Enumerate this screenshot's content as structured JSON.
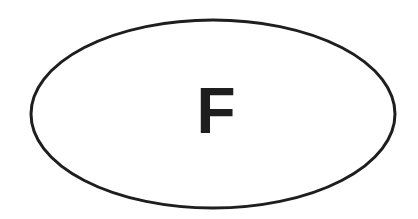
{
  "diagram": {
    "shape": "ellipse",
    "label": "F",
    "stroke_color": "#1e1e1e",
    "fill_color": "#ffffff",
    "background": "#ffffff"
  }
}
